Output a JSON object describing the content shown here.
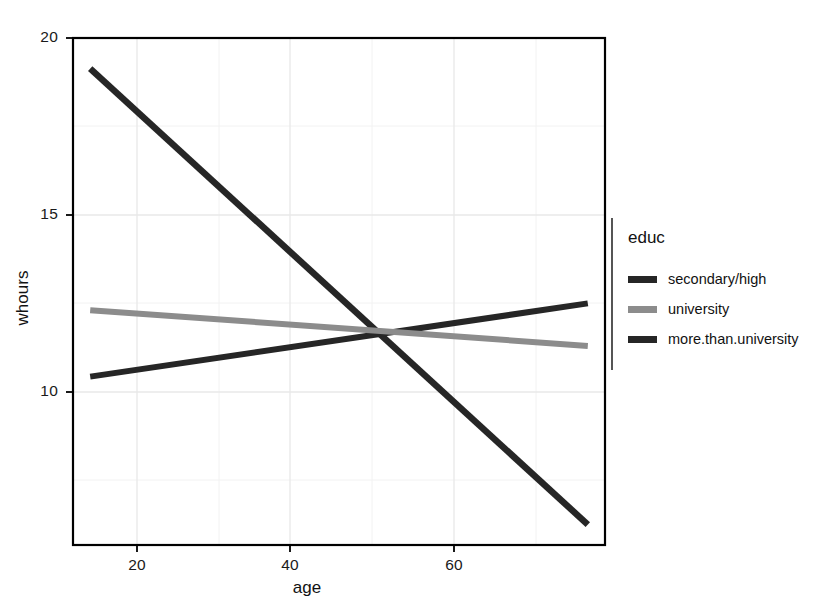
{
  "chart_data": {
    "type": "line",
    "title": "",
    "xlabel": "age",
    "ylabel": "whours",
    "xlim": [
      15,
      77
    ],
    "ylim": [
      5.4,
      20.3
    ],
    "xticks": [
      20,
      40,
      60
    ],
    "xtick_labels": [
      "20",
      "40",
      "60"
    ],
    "yticks": [
      10,
      15,
      20
    ],
    "ytick_labels": [
      "10",
      "15",
      "20"
    ],
    "grid": true,
    "grid_color": "#ebebeb",
    "panel_background": "#ffffff",
    "panel_border_color": "#000000",
    "legend_position": "right",
    "legend_title": "educ",
    "series": [
      {
        "name": "secondary/high",
        "color": "#262626",
        "x": [
          17,
          75
        ],
        "y": [
          19.4,
          6.0
        ],
        "description": "steeply decreasing line"
      },
      {
        "name": "university",
        "color": "#8c8c8c",
        "x": [
          17,
          75
        ],
        "y": [
          12.3,
          11.25
        ],
        "description": "slightly decreasing line"
      },
      {
        "name": "more.than.university",
        "color": "#262626",
        "x": [
          17,
          75
        ],
        "y": [
          10.35,
          12.5
        ],
        "description": "slightly increasing line"
      }
    ],
    "intersection_note": "All three lines converge near age 50 at about 11.6 whours"
  },
  "axes": {
    "y_title": "whours",
    "x_title": "age",
    "y_tick_10": "10",
    "y_tick_15": "15",
    "y_tick_20": "20",
    "x_tick_20": "20",
    "x_tick_40": "40",
    "x_tick_60": "60"
  },
  "legend": {
    "title": "educ",
    "items": [
      {
        "label": "secondary/high",
        "color": "#262626"
      },
      {
        "label": "university",
        "color": "#8c8c8c"
      },
      {
        "label": "more.than.university",
        "color": "#262626"
      }
    ]
  },
  "colors": {
    "dark_line": "#262626",
    "gray_line": "#8c8c8c",
    "grid": "#ebebeb",
    "axis": "#000000",
    "text": "#121212"
  }
}
